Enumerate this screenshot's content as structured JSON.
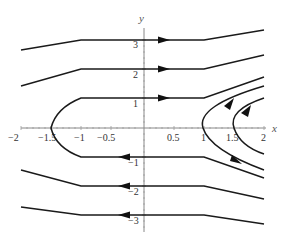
{
  "figure": {
    "type": "phase-portrait",
    "x_axis": {
      "label": "x",
      "ticks": [
        {
          "value": -2,
          "label": "−2"
        },
        {
          "value": -1.5,
          "label": "−1.5"
        },
        {
          "value": -1,
          "label": "−1"
        },
        {
          "value": -0.5,
          "label": "−0.5"
        },
        {
          "value": 0.5,
          "label": "0.5"
        },
        {
          "value": 1,
          "label": "1"
        },
        {
          "value": 1.5,
          "label": "1.5"
        },
        {
          "value": 2,
          "label": "2"
        }
      ],
      "range": [
        -2,
        2
      ]
    },
    "y_axis": {
      "label": "y",
      "ticks": [
        {
          "value": 3,
          "label": "3"
        },
        {
          "value": 2,
          "label": "2"
        },
        {
          "value": 1,
          "label": "1"
        },
        {
          "value": -1,
          "label": "−1"
        },
        {
          "value": -2,
          "label": "−2"
        },
        {
          "value": -3,
          "label": "−3"
        }
      ],
      "range": [
        -3.3,
        3.5
      ]
    },
    "trajectories": [
      {
        "name": "upper-3",
        "direction": "right",
        "level": 3
      },
      {
        "name": "upper-2",
        "direction": "right",
        "level": 2
      },
      {
        "name": "loop-left-1",
        "direction": "right-top/left-bottom",
        "vertex_x": -1.6
      },
      {
        "name": "lower-2",
        "direction": "left",
        "level": -2
      },
      {
        "name": "lower-3",
        "direction": "left",
        "level": -3
      },
      {
        "name": "parabola-vertex-1",
        "direction": "upward",
        "vertex_x": 1
      },
      {
        "name": "parabola-vertex-1.5",
        "direction": "upward",
        "vertex_x": 1.5
      }
    ],
    "colors": {
      "curve": "#1a1a1a",
      "axis": "#888888",
      "background": "#ffffff"
    }
  }
}
